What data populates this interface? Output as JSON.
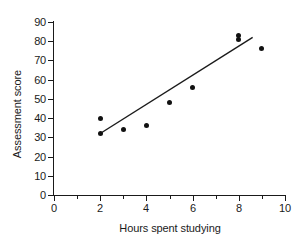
{
  "chart_data": {
    "type": "scatter",
    "title": "",
    "xlabel": "Hours spent studying",
    "ylabel": "Assessment score",
    "xlim": [
      0,
      10
    ],
    "ylim": [
      0,
      90
    ],
    "grid": false,
    "legend": null,
    "x_ticks": [
      0,
      1,
      2,
      3,
      4,
      5,
      6,
      7,
      8,
      9,
      10
    ],
    "x_tick_labels": [
      "0",
      "",
      "2",
      "",
      "4",
      "",
      "6",
      "",
      "8",
      "",
      "10"
    ],
    "y_ticks": [
      0,
      10,
      20,
      30,
      40,
      50,
      60,
      70,
      80,
      90
    ],
    "y_tick_labels": [
      "0",
      "10",
      "20",
      "30",
      "40",
      "50",
      "60",
      "70",
      "80",
      "90"
    ],
    "points": [
      {
        "x": 2,
        "y": 40
      },
      {
        "x": 2,
        "y": 32
      },
      {
        "x": 3,
        "y": 34
      },
      {
        "x": 4,
        "y": 36
      },
      {
        "x": 5,
        "y": 48
      },
      {
        "x": 6,
        "y": 56
      },
      {
        "x": 8,
        "y": 83
      },
      {
        "x": 8,
        "y": 81
      },
      {
        "x": 9,
        "y": 76
      }
    ],
    "marker": {
      "shape": "circle",
      "color": "#111111",
      "size": 5
    },
    "trend_line": {
      "type": "line-of-best-fit",
      "color": "#1a1a1a",
      "x_start": 2.0,
      "y_start": 32,
      "x_end": 8.6,
      "y_end": 82
    },
    "axis_color": "#1a1a1a",
    "background": "#ffffff"
  }
}
